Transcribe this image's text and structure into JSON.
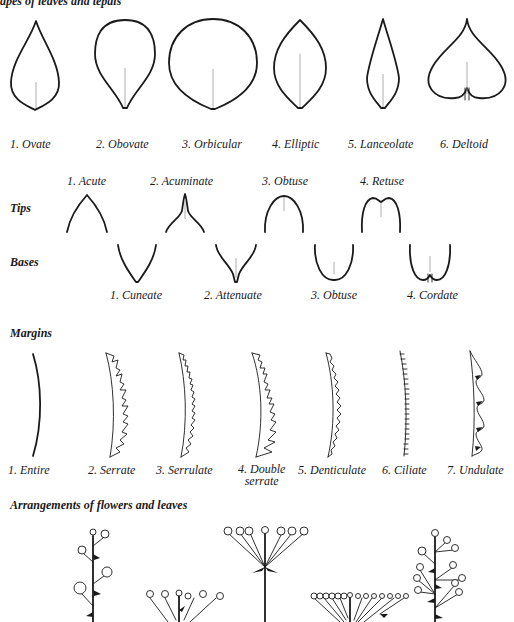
{
  "figure": {
    "top_caption": "apes of leaves and tepals",
    "shapes": [
      {
        "label": "1. Ovate"
      },
      {
        "label": "2. Obovate"
      },
      {
        "label": "3. Orbicular"
      },
      {
        "label": "4. Elliptic"
      },
      {
        "label": "5. Lanceolate"
      },
      {
        "label": "6. Deltoid"
      }
    ],
    "tips": {
      "heading": "Tips",
      "items": [
        {
          "label": "1. Acute"
        },
        {
          "label": "2. Acuminate"
        },
        {
          "label": "3. Obtuse"
        },
        {
          "label": "4. Retuse"
        }
      ]
    },
    "bases": {
      "heading": "Bases",
      "items": [
        {
          "label": "1. Cuneate"
        },
        {
          "label": "2. Attenuate"
        },
        {
          "label": "3. Obtuse"
        },
        {
          "label": "4. Cordate"
        }
      ]
    },
    "margins": {
      "heading": "Margins",
      "items": [
        {
          "label": "1. Entire"
        },
        {
          "label": "2. Serrate"
        },
        {
          "label": "3. Serrulate"
        },
        {
          "label": "4. Double",
          "label_line2": "serrate"
        },
        {
          "label": "5. Denticulate"
        },
        {
          "label": "6. Ciliate"
        },
        {
          "label": "7. Undulate"
        }
      ]
    },
    "arrangements": {
      "heading": "Arrangements of flowers and leaves"
    }
  }
}
